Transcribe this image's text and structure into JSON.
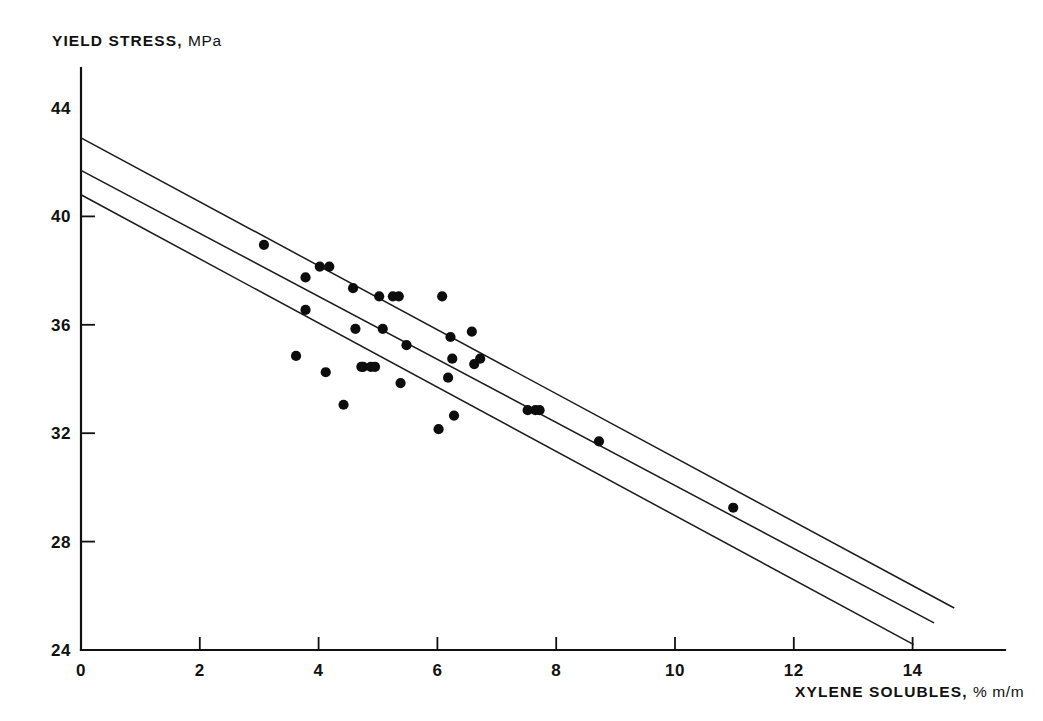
{
  "chart_data": {
    "type": "scatter",
    "title": "",
    "xlabel": "XYLENE SOLUBLES, % m/m",
    "ylabel": "YIELD STRESS, MPa",
    "ylabel_main": "YIELD STRESS,",
    "ylabel_unit": "MPa",
    "xlabel_main": "XYLENE SOLUBLES,",
    "xlabel_unit": "% m/m",
    "xlim": [
      0,
      15
    ],
    "ylim": [
      24,
      44
    ],
    "xticks": [
      0,
      2,
      4,
      6,
      8,
      10,
      12,
      14
    ],
    "yticks": [
      24,
      28,
      32,
      36,
      40,
      44
    ],
    "xtick_labels": [
      "0",
      "2",
      "4",
      "6",
      "8",
      "10",
      "12",
      "14"
    ],
    "ytick_labels": [
      "24",
      "28",
      "32",
      "36",
      "40",
      "44"
    ],
    "grid": false,
    "legend": false,
    "points": [
      {
        "x": 3.08,
        "y": 38.95
      },
      {
        "x": 3.78,
        "y": 37.75
      },
      {
        "x": 4.02,
        "y": 38.15
      },
      {
        "x": 4.18,
        "y": 38.15
      },
      {
        "x": 3.78,
        "y": 36.55
      },
      {
        "x": 3.62,
        "y": 34.85
      },
      {
        "x": 4.12,
        "y": 34.25
      },
      {
        "x": 4.58,
        "y": 37.35
      },
      {
        "x": 4.62,
        "y": 35.85
      },
      {
        "x": 4.42,
        "y": 33.05
      },
      {
        "x": 4.72,
        "y": 34.45
      },
      {
        "x": 4.75,
        "y": 34.45
      },
      {
        "x": 4.88,
        "y": 34.45
      },
      {
        "x": 4.95,
        "y": 34.45
      },
      {
        "x": 5.02,
        "y": 37.05
      },
      {
        "x": 5.25,
        "y": 37.05
      },
      {
        "x": 5.35,
        "y": 37.05
      },
      {
        "x": 5.08,
        "y": 35.85
      },
      {
        "x": 5.38,
        "y": 33.85
      },
      {
        "x": 5.48,
        "y": 35.25
      },
      {
        "x": 6.02,
        "y": 32.15
      },
      {
        "x": 6.08,
        "y": 37.05
      },
      {
        "x": 6.18,
        "y": 34.05
      },
      {
        "x": 6.22,
        "y": 35.55
      },
      {
        "x": 6.25,
        "y": 34.75
      },
      {
        "x": 6.28,
        "y": 32.65
      },
      {
        "x": 6.58,
        "y": 35.75
      },
      {
        "x": 6.62,
        "y": 34.55
      },
      {
        "x": 6.72,
        "y": 34.75
      },
      {
        "x": 7.52,
        "y": 32.85
      },
      {
        "x": 7.65,
        "y": 32.85
      },
      {
        "x": 7.72,
        "y": 32.85
      },
      {
        "x": 8.72,
        "y": 31.7
      },
      {
        "x": 10.98,
        "y": 29.25
      }
    ],
    "lines": [
      {
        "name": "upper-confidence-line",
        "x1": 0.0,
        "y1": 42.9,
        "x2": 14.7,
        "y2": 25.55
      },
      {
        "name": "regression-line",
        "x1": 0.0,
        "y1": 41.7,
        "x2": 14.36,
        "y2": 25.0
      },
      {
        "name": "lower-confidence-line",
        "x1": 0.0,
        "y1": 40.8,
        "x2": 14.02,
        "y2": 24.2
      }
    ]
  }
}
